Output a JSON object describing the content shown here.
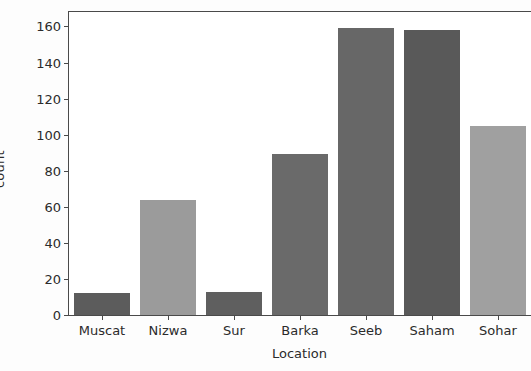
{
  "chart_data": {
    "type": "bar",
    "title": "",
    "xlabel": "Location",
    "ylabel": "count",
    "categories": [
      "Muscat",
      "Nizwa",
      "Sur",
      "Barka",
      "Seeb",
      "Saham",
      "Sohar"
    ],
    "values": [
      12,
      64,
      13,
      89,
      159,
      158,
      105
    ],
    "bar_colors": [
      "#5c5c5c",
      "#9b9b9b",
      "#5f5f5f",
      "#6a6a6a",
      "#676767",
      "#595959",
      "#a0a0a0"
    ],
    "ylim": [
      0,
      168
    ],
    "yticks": [
      0,
      20,
      40,
      60,
      80,
      100,
      120,
      140,
      160
    ],
    "ytick_labels": [
      "0",
      "20",
      "40",
      "60",
      "80",
      "100",
      "120",
      "140",
      "160"
    ],
    "grid": false,
    "legend": null,
    "legend_position": "none",
    "axis_color": "#4a4a4a",
    "text_color": "#2b2b2b",
    "plot_background": "#ffffff",
    "figure_background": "#fdfdfd",
    "bar_width_fraction": 0.86
  }
}
